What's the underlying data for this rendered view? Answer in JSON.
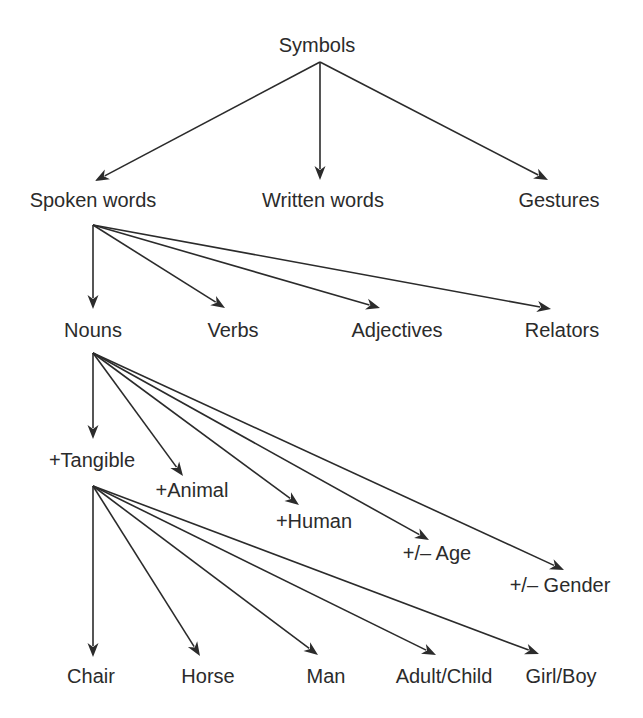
{
  "diagram": {
    "type": "tree",
    "colors": {
      "ink": "#2b2b2b",
      "background": "#ffffff"
    },
    "nodes": [
      {
        "id": "symbols",
        "label": "Symbols",
        "x": 317,
        "y": 52,
        "anchor": "middle"
      },
      {
        "id": "spoken",
        "label": "Spoken words",
        "x": 93,
        "y": 207,
        "anchor": "middle"
      },
      {
        "id": "written",
        "label": "Written words",
        "x": 323,
        "y": 207,
        "anchor": "middle"
      },
      {
        "id": "gestures",
        "label": "Gestures",
        "x": 559,
        "y": 207,
        "anchor": "middle"
      },
      {
        "id": "nouns",
        "label": "Nouns",
        "x": 93,
        "y": 337,
        "anchor": "middle"
      },
      {
        "id": "verbs",
        "label": "Verbs",
        "x": 233,
        "y": 337,
        "anchor": "middle"
      },
      {
        "id": "adjectives",
        "label": "Adjectives",
        "x": 397,
        "y": 337,
        "anchor": "middle"
      },
      {
        "id": "relators",
        "label": "Relators",
        "x": 562,
        "y": 337,
        "anchor": "middle"
      },
      {
        "id": "tangible",
        "label": "+Tangible",
        "x": 92,
        "y": 467,
        "anchor": "middle"
      },
      {
        "id": "animal",
        "label": "+Animal",
        "x": 192,
        "y": 497,
        "anchor": "middle"
      },
      {
        "id": "human",
        "label": "+Human",
        "x": 314,
        "y": 528,
        "anchor": "middle"
      },
      {
        "id": "age",
        "label": "+/– Age",
        "x": 437,
        "y": 560,
        "anchor": "middle"
      },
      {
        "id": "gender",
        "label": "+/– Gender",
        "x": 560,
        "y": 592,
        "anchor": "middle"
      },
      {
        "id": "chair",
        "label": "Chair",
        "x": 91,
        "y": 683,
        "anchor": "middle"
      },
      {
        "id": "horse",
        "label": "Horse",
        "x": 208,
        "y": 683,
        "anchor": "middle"
      },
      {
        "id": "man",
        "label": "Man",
        "x": 326,
        "y": 683,
        "anchor": "middle"
      },
      {
        "id": "adultchild",
        "label": "Adult/Child",
        "x": 444,
        "y": 683,
        "anchor": "middle"
      },
      {
        "id": "girlboy",
        "label": "Girl/Boy",
        "x": 561,
        "y": 683,
        "anchor": "middle"
      }
    ],
    "edges": [
      {
        "from": "symbols",
        "to": "spoken",
        "x1": 320,
        "y1": 62,
        "x2": 95,
        "y2": 181
      },
      {
        "from": "symbols",
        "to": "written",
        "x1": 320,
        "y1": 62,
        "x2": 320,
        "y2": 180
      },
      {
        "from": "symbols",
        "to": "gestures",
        "x1": 320,
        "y1": 62,
        "x2": 548,
        "y2": 180
      },
      {
        "from": "spoken",
        "to": "nouns",
        "x1": 93,
        "y1": 225,
        "x2": 93,
        "y2": 309
      },
      {
        "from": "spoken",
        "to": "verbs",
        "x1": 93,
        "y1": 225,
        "x2": 225,
        "y2": 308
      },
      {
        "from": "spoken",
        "to": "adjectives",
        "x1": 93,
        "y1": 225,
        "x2": 380,
        "y2": 308
      },
      {
        "from": "spoken",
        "to": "relators",
        "x1": 93,
        "y1": 225,
        "x2": 551,
        "y2": 309
      },
      {
        "from": "nouns",
        "to": "tangible",
        "x1": 93,
        "y1": 353,
        "x2": 93,
        "y2": 439
      },
      {
        "from": "nouns",
        "to": "animal",
        "x1": 93,
        "y1": 353,
        "x2": 183,
        "y2": 476
      },
      {
        "from": "nouns",
        "to": "human",
        "x1": 93,
        "y1": 353,
        "x2": 299,
        "y2": 505
      },
      {
        "from": "nouns",
        "to": "age",
        "x1": 93,
        "y1": 353,
        "x2": 429,
        "y2": 540
      },
      {
        "from": "nouns",
        "to": "gender",
        "x1": 93,
        "y1": 353,
        "x2": 564,
        "y2": 570
      },
      {
        "from": "tangible",
        "to": "chair",
        "x1": 93,
        "y1": 486,
        "x2": 93,
        "y2": 657
      },
      {
        "from": "tangible",
        "to": "horse",
        "x1": 93,
        "y1": 486,
        "x2": 200,
        "y2": 656
      },
      {
        "from": "tangible",
        "to": "man",
        "x1": 93,
        "y1": 486,
        "x2": 318,
        "y2": 655
      },
      {
        "from": "tangible",
        "to": "adultchild",
        "x1": 93,
        "y1": 486,
        "x2": 436,
        "y2": 655
      },
      {
        "from": "tangible",
        "to": "girlboy",
        "x1": 93,
        "y1": 486,
        "x2": 539,
        "y2": 654
      }
    ]
  }
}
